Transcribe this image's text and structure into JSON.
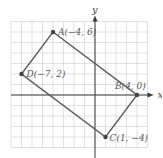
{
  "figure": {
    "type": "coordinate-plane",
    "axes": {
      "x_label": "x",
      "y_label": "y"
    },
    "grid": {
      "x_min": -8,
      "x_max": 5,
      "y_min": -5,
      "y_max": 7,
      "step": 1
    },
    "shape": "rectangle",
    "points": [
      {
        "name": "A",
        "x": -4,
        "y": 6,
        "label": "A(−4, 6)"
      },
      {
        "name": "B",
        "x": 4,
        "y": 0,
        "label": "B(4, 0)"
      },
      {
        "name": "C",
        "x": 1,
        "y": -4,
        "label": "C(1, −4)"
      },
      {
        "name": "D",
        "x": -7,
        "y": 2,
        "label": "D(−7, 2)"
      }
    ],
    "colors": {
      "grid": "#d4d4d4",
      "axis": "#3a3a3a",
      "edge": "#5a5a5a",
      "label": "#5a5a5a"
    }
  }
}
